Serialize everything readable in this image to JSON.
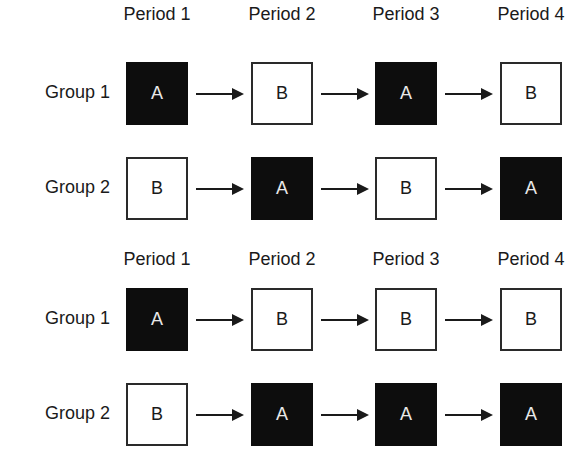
{
  "diagrams": [
    {
      "periods": [
        "Period 1",
        "Period 2",
        "Period 3",
        "Period 4"
      ],
      "groups": [
        {
          "label": "Group 1",
          "sequence": [
            "A",
            "B",
            "A",
            "B"
          ]
        },
        {
          "label": "Group 2",
          "sequence": [
            "B",
            "A",
            "B",
            "A"
          ]
        }
      ]
    },
    {
      "periods": [
        "Period 1",
        "Period 2",
        "Period 3",
        "Period 4"
      ],
      "groups": [
        {
          "label": "Group 1",
          "sequence": [
            "A",
            "B",
            "B",
            "B"
          ]
        },
        {
          "label": "Group 2",
          "sequence": [
            "B",
            "A",
            "A",
            "A"
          ]
        }
      ]
    }
  ],
  "legend_colors": {
    "A": "#0d0d0d",
    "B": "#ffffff"
  }
}
